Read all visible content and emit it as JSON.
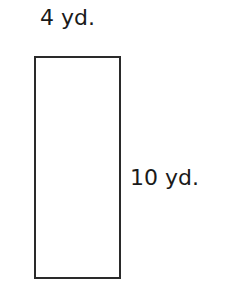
{
  "diagram": {
    "shape": "rectangle",
    "width_label": "4 yd.",
    "height_label": "10 yd.",
    "stroke_color": "#2a2a2a",
    "background": "#ffffff"
  }
}
